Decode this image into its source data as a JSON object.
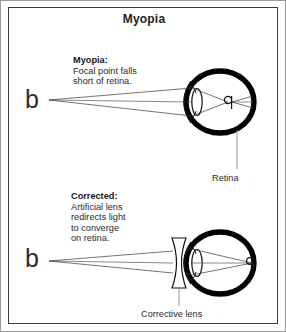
{
  "figure": {
    "title": "Myopia",
    "border_color": "#9a9a9a",
    "frame_color": "#3c3c3c",
    "background": "#ffffff",
    "ink_color": "#000000"
  },
  "panels": {
    "uncorrected": {
      "heading": "Myopia:",
      "body": "Focal point falls\nshort of retina.",
      "object_letter": "b",
      "image_letter": "q"
    },
    "corrected": {
      "heading": "Corrected:",
      "body": "Artificial lens\nredirects light\nto converge\non retina.",
      "object_letter": "b",
      "image_letter": "q"
    }
  },
  "labels": {
    "retina": "Retina",
    "corrective_lens": "Corrective lens"
  },
  "diagram": {
    "type": "optics-ray-diagram",
    "eye_top": {
      "cx": 219,
      "cy": 101,
      "rx": 36,
      "ry": 32,
      "wall_thickness": 5
    },
    "eye_bottom": {
      "cx": 219,
      "cy": 262,
      "rx": 36,
      "ry": 32,
      "wall_thickness": 5
    },
    "focal_point_top": {
      "x": 229,
      "y": 101,
      "note": "short of retina"
    },
    "focal_point_bottom": {
      "x": 252,
      "y": 262,
      "note": "on retina"
    },
    "corrective_lens": {
      "x": 178,
      "y": 262,
      "shape": "biconcave"
    }
  }
}
